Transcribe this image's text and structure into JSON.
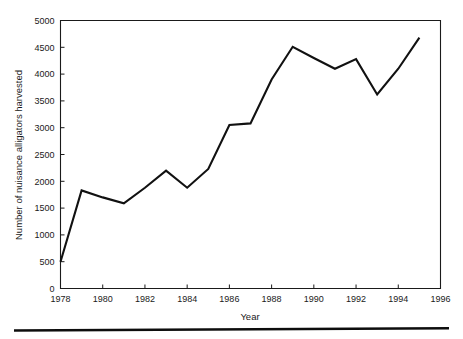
{
  "chart_data": {
    "type": "line",
    "title": "",
    "xlabel": "Year",
    "ylabel": "Number of nuisance alligators harvested",
    "xlim": [
      1978,
      1996
    ],
    "ylim": [
      0,
      5000
    ],
    "grid": false,
    "legend": null,
    "x": [
      1978,
      1979,
      1980,
      1981,
      1982,
      1983,
      1984,
      1985,
      1986,
      1987,
      1988,
      1989,
      1990,
      1991,
      1992,
      1993,
      1994,
      1995
    ],
    "values": [
      500,
      1830,
      1700,
      1590,
      1880,
      2200,
      1880,
      2230,
      3050,
      3080,
      3900,
      4510,
      4300,
      4100,
      4280,
      3620,
      4100,
      4680
    ],
    "xticks": [
      1978,
      1980,
      1982,
      1984,
      1986,
      1988,
      1990,
      1992,
      1994,
      1996
    ],
    "xtick_labels": [
      "1978",
      "1980",
      "1982",
      "1984",
      "1986",
      "1988",
      "1990",
      "1992",
      "1994",
      "1996"
    ],
    "yticks": [
      0,
      500,
      1000,
      1500,
      2000,
      2500,
      3000,
      3500,
      4000,
      4500,
      5000
    ],
    "ytick_labels": [
      "0",
      "500",
      "1000",
      "1500",
      "2000",
      "2500",
      "3000",
      "3500",
      "4000",
      "4500",
      "5000"
    ],
    "line_color": "#111111",
    "axis_color": "#1a1a1a",
    "background_color": "#ffffff"
  },
  "figure": {
    "footer_rule_name": "horizontal-rule"
  }
}
